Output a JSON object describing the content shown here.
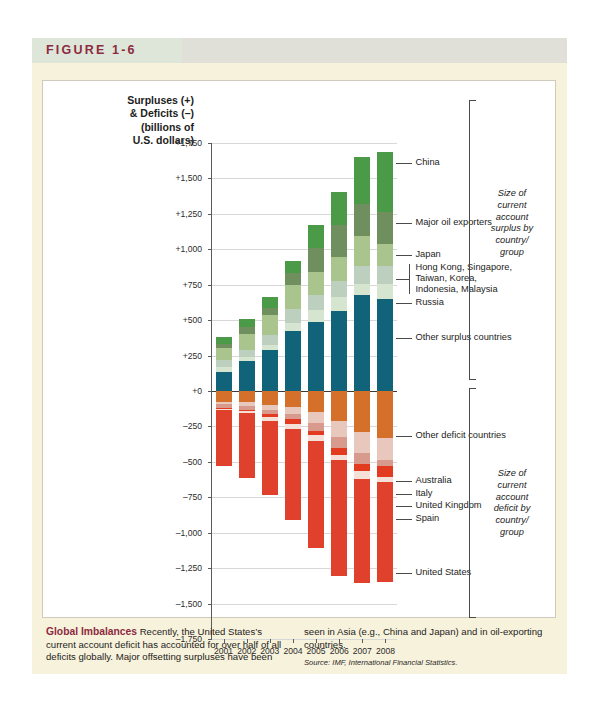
{
  "figure": {
    "label": "FIGURE 1-6"
  },
  "axis": {
    "y_title_lines": [
      "Surpluses (+)",
      "& Deficits (–)",
      "(billions of",
      "U.S. dollars)"
    ],
    "y_ticks": [
      "+1,750",
      "+1,500",
      "+1,250",
      "+1,000",
      "+750",
      "+500",
      "+250",
      "+0",
      "–250",
      "–500",
      "–750",
      "–1,000",
      "–1,250",
      "–1,500",
      "–1,750"
    ]
  },
  "callouts_surplus": [
    {
      "label": "China"
    },
    {
      "label": "Major oil exporters"
    },
    {
      "label": "Japan"
    },
    {
      "label": "Hong Kong, Singapore,\nTaiwan, Korea,\nIndonesia, Malaysia"
    },
    {
      "label": "Russia"
    },
    {
      "label": "Other surplus countries"
    }
  ],
  "callouts_deficit": [
    {
      "label": "Other deficit countries"
    },
    {
      "label": "Australia"
    },
    {
      "label": "Italy"
    },
    {
      "label": "United Kingdom"
    },
    {
      "label": "Spain"
    },
    {
      "label": "United States"
    }
  ],
  "brackets": [
    {
      "id": "surplus",
      "text": "Size of\ncurrent\naccount\nsurplus by\ncountry/\ngroup"
    },
    {
      "id": "deficit",
      "text": "Size of\ncurrent\naccount\ndeficit by\ncountry/\ngroup"
    }
  ],
  "caption": {
    "headline": "Global Imbalances",
    "col1": " Recently, the United States’s current account deficit has accounted for over half of all deficits globally. Major offsetting surpluses have been",
    "col2": "seen in Asia (e.g., China and Japan) and in oil-exporting countries.",
    "source": "Source: IMF, International Financial Statistics."
  },
  "chart_data": {
    "type": "bar",
    "subtype": "stacked-diverging",
    "xlabel": "",
    "ylabel": "Surpluses (+) & Deficits (–) (billions of U.S. dollars)",
    "ylim": [
      -1750,
      1750
    ],
    "ytick_step": 250,
    "grid": true,
    "legend_position": "right-callouts",
    "categories": [
      "2001",
      "2002",
      "2003",
      "2004",
      "2005",
      "2006",
      "2007",
      "2008"
    ],
    "surplus_series": [
      {
        "name": "Other surplus countries",
        "color": "#106379",
        "values": [
          135,
          210,
          290,
          425,
          490,
          565,
          680,
          650
        ]
      },
      {
        "name": "Russia",
        "color": "#d6e5cf",
        "values": [
          33,
          30,
          35,
          58,
          84,
          95,
          77,
          102
        ]
      },
      {
        "name": "Hong Kong, Singapore, Taiwan, Korea, Indonesia, Malaysia",
        "color": "#bdd0c0",
        "values": [
          48,
          52,
          72,
          95,
          100,
          116,
          125,
          128
        ]
      },
      {
        "name": "Japan",
        "color": "#a9c48c",
        "values": [
          88,
          112,
          136,
          172,
          166,
          170,
          211,
          157
        ]
      },
      {
        "name": "Major oil exporters",
        "color": "#6f8f5e",
        "values": [
          30,
          45,
          55,
          82,
          170,
          225,
          228,
          225
        ]
      },
      {
        "name": "China",
        "color": "#4a9a47",
        "values": [
          45,
          60,
          78,
          85,
          160,
          230,
          330,
          425
        ]
      }
    ],
    "deficit_series": [
      {
        "name": "Other deficit countries",
        "color": "#d4702a",
        "values": [
          -75,
          -80,
          -100,
          -110,
          -145,
          -215,
          -290,
          -330
        ]
      },
      {
        "name": "Spain",
        "color": "#e8c8bc",
        "values": [
          -18,
          -24,
          -32,
          -55,
          -83,
          -108,
          -145,
          -155
        ]
      },
      {
        "name": "United Kingdom",
        "color": "#d79a8c",
        "values": [
          -30,
          -28,
          -27,
          -36,
          -56,
          -78,
          -80,
          -45
        ]
      },
      {
        "name": "Italy",
        "color": "#e23b20",
        "values": [
          -2,
          -10,
          -22,
          -30,
          -30,
          -48,
          -52,
          -78
        ]
      },
      {
        "name": "Australia",
        "color": "#f4e0d6",
        "values": [
          -8,
          -16,
          -28,
          -40,
          -42,
          -41,
          -57,
          -36
        ]
      },
      {
        "name": "United States",
        "color": "#e0412c",
        "values": [
          -398,
          -459,
          -522,
          -640,
          -755,
          -812,
          -731,
          -706
        ]
      }
    ]
  }
}
